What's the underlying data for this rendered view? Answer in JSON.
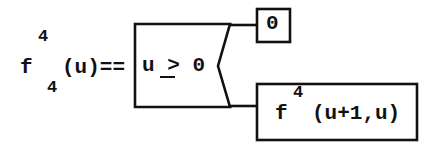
{
  "diagram": {
    "kind": "recursive-function-definition",
    "stroke_color": "#111111",
    "background_color": "#ffffff",
    "line_width": 2.4
  },
  "lhs": {
    "function_name": "f",
    "superscript": "4",
    "subscript": "4",
    "arguments": "(u)",
    "definition_operator": "==",
    "arguments_and_operator": "(u)=="
  },
  "condition_box": {
    "label": "predicate",
    "variable": "u",
    "relation_glyph": ">",
    "relation_meaning": "≥",
    "value": "0",
    "text": "u > 0",
    "full_text": "u ≥ 0"
  },
  "zero_box": {
    "label": "true-branch-result",
    "text": "0"
  },
  "recursive_box": {
    "label": "false-branch-result",
    "function_name": "f",
    "superscript": "4",
    "arguments": "(u+1,u)",
    "full_text": "f 4 (u+1,u)"
  },
  "connectors": {
    "true_branch": "top connector from condition box to result 0",
    "false_branch": "bottom connector from condition box to recursive call"
  }
}
